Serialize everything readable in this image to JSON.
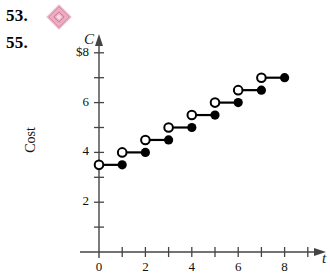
{
  "problems": [
    {
      "number": "53.",
      "has_icon": true,
      "icon": "pink-diamond-icon"
    },
    {
      "number": "55.",
      "has_icon": false
    }
  ],
  "icon_colors": {
    "diamond_outer": "#e9a8bd",
    "diamond_mid": "#f2cbd8",
    "diamond_inner": "#d9738f"
  },
  "chart_data": {
    "type": "line",
    "subtype": "step",
    "title": "",
    "xlabel": "t",
    "ylabel": "Cost",
    "yaxis_letter": "C",
    "xlim": [
      0,
      9
    ],
    "ylim": [
      0,
      8.6
    ],
    "grid": false,
    "legend": null,
    "x_ticks": [
      0,
      1,
      2,
      3,
      4,
      5,
      6,
      7,
      8,
      9
    ],
    "x_tick_labels": [
      "0",
      "",
      "2",
      "",
      "4",
      "",
      "6",
      "",
      "8",
      ""
    ],
    "y_ticks": [
      1,
      2,
      3,
      4,
      5,
      6,
      7,
      8
    ],
    "y_tick_labels": [
      "",
      "2",
      "",
      "4",
      "",
      "6",
      "",
      "$8"
    ],
    "endpoint_style": {
      "left": "open-circle",
      "right": "filled-circle"
    },
    "steps": [
      {
        "x_start": 0,
        "x_end": 1,
        "y": 3.5
      },
      {
        "x_start": 1,
        "x_end": 2,
        "y": 4.0
      },
      {
        "x_start": 2,
        "x_end": 3,
        "y": 4.5
      },
      {
        "x_start": 3,
        "x_end": 4,
        "y": 5.0
      },
      {
        "x_start": 4,
        "x_end": 5,
        "y": 5.5
      },
      {
        "x_start": 5,
        "x_end": 6,
        "y": 6.0
      },
      {
        "x_start": 6,
        "x_end": 7,
        "y": 6.5
      },
      {
        "x_start": 7,
        "x_end": 8,
        "y": 7.0
      }
    ]
  }
}
